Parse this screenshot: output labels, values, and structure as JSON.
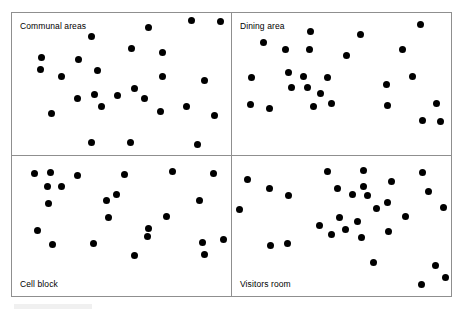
{
  "figure": {
    "title": "",
    "panel_count": 4,
    "frame_color": "#8f8f8f",
    "dot_color": "#000000",
    "background_color": "#ffffff"
  },
  "panels": [
    {
      "id": "communal-areas",
      "label": "Communal areas",
      "label_position": "top-left"
    },
    {
      "id": "dining-area",
      "label": "Dining area",
      "label_position": "top-left"
    },
    {
      "id": "cell-block",
      "label": "Cell block",
      "label_position": "bottom-left"
    },
    {
      "id": "visitors-room",
      "label": "Visitors room",
      "label_position": "bottom-left"
    }
  ],
  "chart_data": {
    "type": "scatter",
    "title": "",
    "subtitle": "",
    "xlabel": "",
    "ylabel": "",
    "grid": false,
    "legend": "none",
    "axis_ticks": "none",
    "layout": "2x2 small multiples",
    "xlim": [
      0,
      100
    ],
    "ylim": [
      0,
      100
    ],
    "note": "Each panel is a dot-density map of one prison location; x/y are normalised panel coordinates (0-100), y measured downward from the panel top.",
    "series": [
      {
        "name": "Communal areas",
        "marker": "filled-circle",
        "color": "#000000",
        "count": 29,
        "points": [
          [
            36.5,
            16.5
          ],
          [
            62.5,
            10.5
          ],
          [
            82.0,
            5.5
          ],
          [
            95.0,
            6.0
          ],
          [
            13.5,
            31.5
          ],
          [
            30.5,
            33.0
          ],
          [
            54.5,
            25.0
          ],
          [
            68.5,
            28.0
          ],
          [
            13.0,
            40.0
          ],
          [
            22.5,
            44.5
          ],
          [
            39.0,
            40.5
          ],
          [
            68.5,
            44.5
          ],
          [
            88.0,
            47.5
          ],
          [
            30.0,
            60.5
          ],
          [
            37.5,
            57.5
          ],
          [
            48.0,
            58.0
          ],
          [
            56.0,
            53.0
          ],
          [
            60.5,
            60.5
          ],
          [
            41.0,
            65.5
          ],
          [
            18.0,
            71.0
          ],
          [
            68.0,
            69.5
          ],
          [
            79.5,
            66.0
          ],
          [
            92.5,
            72.5
          ],
          [
            36.5,
            91.0
          ],
          [
            54.0,
            91.5
          ],
          [
            84.5,
            92.5
          ]
        ]
      },
      {
        "name": "Dining area",
        "marker": "filled-circle",
        "color": "#000000",
        "count": 27,
        "points": [
          [
            36.0,
            13.0
          ],
          [
            58.5,
            15.0
          ],
          [
            86.0,
            8.0
          ],
          [
            14.5,
            21.0
          ],
          [
            24.5,
            25.5
          ],
          [
            35.5,
            26.0
          ],
          [
            52.5,
            30.0
          ],
          [
            78.0,
            25.5
          ],
          [
            9.0,
            45.5
          ],
          [
            26.0,
            42.0
          ],
          [
            32.5,
            45.0
          ],
          [
            43.5,
            45.5
          ],
          [
            70.5,
            50.0
          ],
          [
            82.5,
            44.5
          ],
          [
            27.0,
            52.5
          ],
          [
            34.5,
            52.5
          ],
          [
            40.5,
            56.5
          ],
          [
            8.5,
            64.5
          ],
          [
            17.0,
            67.0
          ],
          [
            37.0,
            66.0
          ],
          [
            45.5,
            64.0
          ],
          [
            71.0,
            65.0
          ],
          [
            93.5,
            63.5
          ],
          [
            87.0,
            76.0
          ],
          [
            95.0,
            76.5
          ]
        ]
      },
      {
        "name": "Cell block",
        "marker": "filled-circle",
        "color": "#000000",
        "count": 24,
        "points": [
          [
            10.5,
            12.5
          ],
          [
            17.5,
            11.5
          ],
          [
            30.0,
            14.0
          ],
          [
            51.5,
            13.0
          ],
          [
            73.5,
            11.0
          ],
          [
            92.0,
            12.5
          ],
          [
            16.0,
            22.0
          ],
          [
            22.5,
            21.5
          ],
          [
            16.5,
            34.0
          ],
          [
            43.0,
            31.5
          ],
          [
            47.5,
            27.5
          ],
          [
            85.5,
            31.5
          ],
          [
            44.0,
            44.0
          ],
          [
            70.5,
            43.0
          ],
          [
            11.5,
            53.0
          ],
          [
            62.5,
            51.5
          ],
          [
            18.5,
            63.5
          ],
          [
            37.0,
            62.5
          ],
          [
            62.0,
            57.5
          ],
          [
            87.0,
            62.0
          ],
          [
            96.5,
            59.5
          ],
          [
            88.0,
            70.5
          ],
          [
            56.0,
            71.0
          ]
        ]
      },
      {
        "name": "Visitors room",
        "marker": "filled-circle",
        "color": "#000000",
        "count": 31,
        "points": [
          [
            43.5,
            11.0
          ],
          [
            7.0,
            17.0
          ],
          [
            60.0,
            10.5
          ],
          [
            87.0,
            11.5
          ],
          [
            17.0,
            23.5
          ],
          [
            48.0,
            23.5
          ],
          [
            60.0,
            21.5
          ],
          [
            73.0,
            18.5
          ],
          [
            26.0,
            28.5
          ],
          [
            62.0,
            28.5
          ],
          [
            89.5,
            25.0
          ],
          [
            55.0,
            27.5
          ],
          [
            71.0,
            33.0
          ],
          [
            3.5,
            38.5
          ],
          [
            66.0,
            37.5
          ],
          [
            96.5,
            36.5
          ],
          [
            49.0,
            44.0
          ],
          [
            57.5,
            46.5
          ],
          [
            79.0,
            43.5
          ],
          [
            40.0,
            49.5
          ],
          [
            52.0,
            52.5
          ],
          [
            45.5,
            56.0
          ],
          [
            71.5,
            54.0
          ],
          [
            17.5,
            64.0
          ],
          [
            25.5,
            62.5
          ],
          [
            59.0,
            58.5
          ],
          [
            64.5,
            76.0
          ],
          [
            93.0,
            78.5
          ],
          [
            97.5,
            86.5
          ],
          [
            86.5,
            92.0
          ]
        ]
      }
    ]
  }
}
